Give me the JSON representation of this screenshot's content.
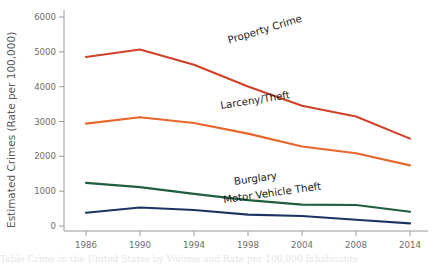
{
  "chart_data": {
    "type": "line",
    "title": "",
    "xlabel": "",
    "ylabel": "Estimated Crimes (Rate per 100,000)",
    "xlim": [
      1984,
      2015
    ],
    "ylim": [
      0,
      6000
    ],
    "grid": false,
    "legend_position": "inline-labels",
    "x_ticks": [
      1986,
      1990,
      1994,
      1998,
      2004,
      2008,
      2014
    ],
    "x_tick_labels": [
      "1986",
      "1990",
      "1994",
      "1998",
      "2004",
      "2008",
      "2014"
    ],
    "y_ticks": [
      0,
      1000,
      2000,
      3000,
      4000,
      5000,
      6000
    ],
    "y_tick_labels": [
      "0",
      "1000",
      "2000",
      "3000",
      "4000",
      "5000",
      "6000"
    ],
    "x": [
      1986,
      1990,
      1994,
      1998,
      2004,
      2008,
      2014
    ],
    "series": [
      {
        "name": "Property Crime",
        "color": "#D2402A",
        "values": [
          4880,
          5090,
          4660,
          4050,
          3510,
          3210,
          2590
        ],
        "label": "Property Crime",
        "label_rotation": -17
      },
      {
        "name": "Larceny/Theft",
        "color": "#E8662B",
        "values": [
          3010,
          3190,
          3030,
          2730,
          2370,
          2180,
          1840
        ],
        "label": "Larceny/Theft",
        "label_rotation": -9
      },
      {
        "name": "Burglary",
        "color": "#1E5E3F",
        "values": [
          1350,
          1230,
          1040,
          865,
          740,
          730,
          540
        ],
        "label": "Burglary",
        "label_rotation": -8
      },
      {
        "name": "Motor Vehicle Theft",
        "color": "#1C3462",
        "values": [
          510,
          660,
          590,
          460,
          420,
          315,
          215
        ],
        "label": "Motor Vehicle Theft",
        "label_rotation": -8
      }
    ],
    "series_label_positions": [
      {
        "x": 1996.6,
        "y": 5250
      },
      {
        "x": 1996.0,
        "y": 3420
      },
      {
        "x": 1997.0,
        "y": 1290
      },
      {
        "x": 1996.2,
        "y": 780
      }
    ]
  },
  "footer": {
    "cut_off_text": "Table Crime in the United States by Volume and Rate per 100,000 Inhabitants"
  }
}
